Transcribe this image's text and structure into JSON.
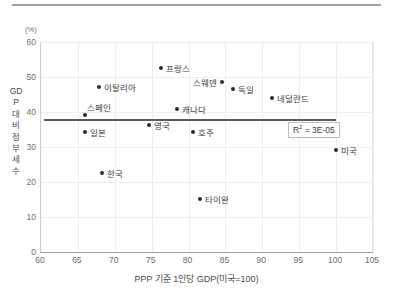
{
  "chart_data": {
    "type": "scatter",
    "title": "",
    "unit_label": "(%)",
    "xlabel": "PPP 기준 1인당 GDP(미국=100)",
    "ylabel": "GDP 대비 정부세수",
    "xlim": [
      60,
      105
    ],
    "ylim": [
      0,
      60
    ],
    "xticks": [
      60,
      65,
      70,
      75,
      80,
      85,
      90,
      95,
      100,
      105
    ],
    "yticks": [
      0,
      10,
      20,
      30,
      40,
      50,
      60
    ],
    "grid": true,
    "legend": "none",
    "marker_color": "#2b2b2b",
    "trendline": {
      "label": "R² = 3E-05",
      "r_squared_text": "3E-05",
      "x_start": 60.4,
      "x_end": 100.0,
      "y_start": 38.0,
      "y_end": 38.0,
      "color": "#5a5a5a"
    },
    "points": [
      {
        "name": "프랑스",
        "x": 76.3,
        "y": 52.7,
        "label_pos": "right"
      },
      {
        "name": "스웨덴",
        "x": 84.5,
        "y": 48.7,
        "label_pos": "left"
      },
      {
        "name": "이탈리아",
        "x": 67.8,
        "y": 47.2,
        "label_pos": "right"
      },
      {
        "name": "독일",
        "x": 86.0,
        "y": 46.7,
        "label_pos": "right"
      },
      {
        "name": "네덜란드",
        "x": 91.3,
        "y": 44.0,
        "label_pos": "right"
      },
      {
        "name": "캐나다",
        "x": 78.4,
        "y": 40.8,
        "label_pos": "right"
      },
      {
        "name": "스페인",
        "x": 66.0,
        "y": 39.1,
        "label_pos": "above"
      },
      {
        "name": "영국",
        "x": 74.6,
        "y": 36.3,
        "label_pos": "right"
      },
      {
        "name": "호주",
        "x": 80.6,
        "y": 34.3,
        "label_pos": "right"
      },
      {
        "name": "일본",
        "x": 66.0,
        "y": 34.2,
        "label_pos": "right"
      },
      {
        "name": "미국",
        "x": 100.0,
        "y": 29.2,
        "label_pos": "right"
      },
      {
        "name": "한국",
        "x": 68.3,
        "y": 22.7,
        "label_pos": "right"
      },
      {
        "name": "타이완",
        "x": 81.5,
        "y": 15.2,
        "label_pos": "right"
      }
    ]
  }
}
